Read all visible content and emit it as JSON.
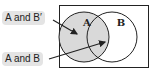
{
  "diagram": {
    "type": "venn",
    "sets": [
      {
        "name": "A",
        "label": "A",
        "shaded": true
      },
      {
        "name": "B",
        "label": "B",
        "shaded": false
      }
    ],
    "callouts": [
      {
        "label": "A and B′",
        "points_to": "A only region"
      },
      {
        "label": "A and B",
        "points_to": "intersection of A and B"
      }
    ],
    "colors": {
      "shade": "#d9d9d9",
      "stroke": "#222222",
      "label_bg": "#e4e4e4"
    }
  }
}
